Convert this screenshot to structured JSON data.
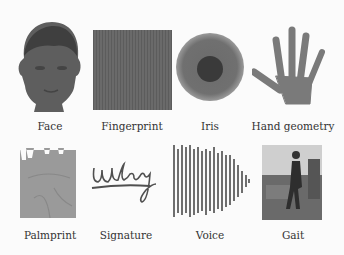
{
  "figure": {
    "items": [
      {
        "label": "Face",
        "icon": "face-image"
      },
      {
        "label": "Fingerprint",
        "icon": "fingerprint-image"
      },
      {
        "label": "Iris",
        "icon": "iris-image"
      },
      {
        "label": "Hand geometry",
        "icon": "hand-image"
      },
      {
        "label": "Palmprint",
        "icon": "palmprint-image"
      },
      {
        "label": "Signature",
        "icon": "signature-image"
      },
      {
        "label": "Voice",
        "icon": "voice-waveform-image"
      },
      {
        "label": "Gait",
        "icon": "gait-image"
      }
    ],
    "colors": {
      "background": "#fbfbfb",
      "image_gray": "#6a6a6a",
      "dark_gray": "#4a4a4a"
    }
  }
}
